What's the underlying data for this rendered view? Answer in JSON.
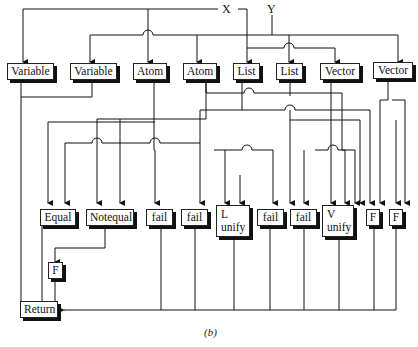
{
  "inputs": {
    "x": "X",
    "y": "Y"
  },
  "type_tests": [
    {
      "label": "Variable"
    },
    {
      "label": "Variable"
    },
    {
      "label": "Atom"
    },
    {
      "label": "Atom"
    },
    {
      "label": "List"
    },
    {
      "label": "List"
    },
    {
      "label": "Vector"
    },
    {
      "label": "Vector"
    }
  ],
  "results": [
    {
      "label": "Equal"
    },
    {
      "label": "Notequal"
    },
    {
      "label": "fail"
    },
    {
      "label": "fail"
    },
    {
      "label_line1": "L",
      "label_line2": "unify"
    },
    {
      "label": "fail"
    },
    {
      "label": "fail"
    },
    {
      "label_line1": "V",
      "label_line2": "unify"
    },
    {
      "label": "F"
    },
    {
      "label": "F"
    }
  ],
  "notequal_false": {
    "label": "F"
  },
  "return": {
    "label": "Return"
  },
  "caption": "(b)",
  "colors": {
    "line": "#111111",
    "box_fill": "#ffffff",
    "shadow": "#111111"
  }
}
